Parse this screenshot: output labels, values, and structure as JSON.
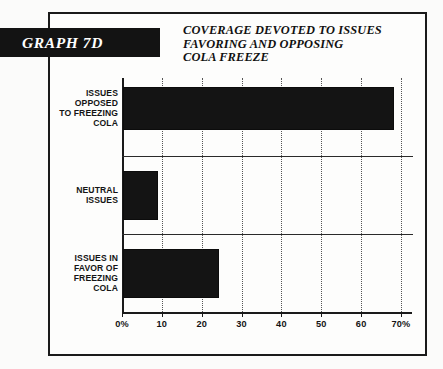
{
  "badge": {
    "label": "GRAPH 7D"
  },
  "title": {
    "line1": "COVERAGE DEVOTED TO ISSUES",
    "line2": "FAVORING AND OPPOSING",
    "line3": "COLA FREEZE"
  },
  "colors": {
    "bar": "#141414",
    "frame": "#1a1a1a",
    "badge_bg": "#131313",
    "badge_text": "#ffffff",
    "background": "#fdfdfc",
    "grid": "#555555"
  },
  "chart_data": {
    "type": "bar",
    "orientation": "horizontal",
    "title": "COVERAGE DEVOTED TO ISSUES FAVORING AND OPPOSING COLA FREEZE",
    "xlabel": "",
    "ylabel": "",
    "xlim": [
      0,
      70
    ],
    "grid": true,
    "legend": false,
    "tick_labels": [
      "0%",
      "10",
      "20",
      "30",
      "40",
      "50",
      "60",
      "70%"
    ],
    "tick_values": [
      0,
      10,
      20,
      30,
      40,
      50,
      60,
      70
    ],
    "categories": [
      {
        "lines": [
          "ISSUES",
          "OPPOSED",
          "TO FREEZING",
          "COLA"
        ],
        "value": 68
      },
      {
        "lines": [
          "NEUTRAL",
          "ISSUES"
        ],
        "value": 8.7
      },
      {
        "lines": [
          "ISSUES IN",
          "FAVOR OF",
          "FREEZING",
          "COLA"
        ],
        "value": 24
      }
    ],
    "values": [
      68,
      8.7,
      24
    ]
  }
}
